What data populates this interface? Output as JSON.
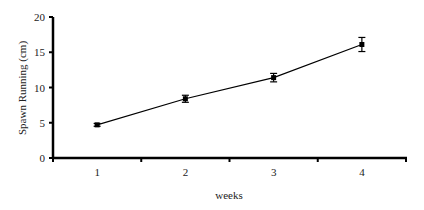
{
  "chart_data": {
    "type": "line",
    "title": "",
    "xlabel": "weeks",
    "ylabel": "Spawn Running (cm)",
    "categories": [
      "1",
      "2",
      "3",
      "4"
    ],
    "series": [
      {
        "name": "Spawn Running",
        "values": [
          4.7,
          8.4,
          11.4,
          16.1
        ],
        "errors": [
          0.2,
          0.5,
          0.6,
          1.0
        ],
        "marker": "diamond",
        "color": "#000000"
      }
    ],
    "ylim": [
      0,
      20
    ],
    "yticks": [
      "0",
      "5",
      "10",
      "15",
      "20"
    ],
    "grid": false,
    "legend": "none"
  }
}
